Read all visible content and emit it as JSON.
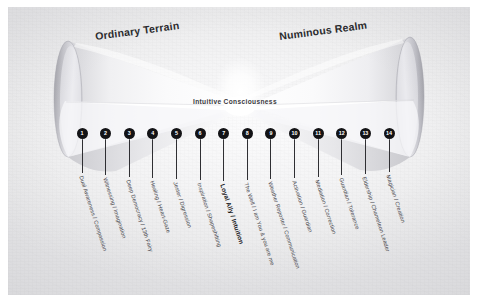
{
  "diagram": {
    "title_left": "Ordinary Terrain",
    "title_right": "Numinous Realm",
    "center_axis_label": "Intuitive Consciousness",
    "nodes": [
      {
        "number": "1",
        "label": "Dual Awareness / Compassion"
      },
      {
        "number": "2",
        "label": "Witnessing / Imagination"
      },
      {
        "number": "3",
        "label": "Deep Democracy / 13th Fairy"
      },
      {
        "number": "4",
        "label": "Healing / Heart-Gaze"
      },
      {
        "number": "5",
        "label": "Jester / Digression"
      },
      {
        "number": "6",
        "label": "Inspiration / Shapeshifting"
      },
      {
        "number": "7",
        "label": "Loyal Ally / Intuition"
      },
      {
        "number": "8",
        "label": "The Well / I am You & you are me"
      },
      {
        "number": "9",
        "label": "Weather Reporter / Communication"
      },
      {
        "number": "10",
        "label": "Activation / Guardian"
      },
      {
        "number": "11",
        "label": "Mediation / Correction"
      },
      {
        "number": "12",
        "label": "Guardian / Tolerance"
      },
      {
        "number": "13",
        "label": "Eldership / Chameleon Leader"
      },
      {
        "number": "14",
        "label": "Magician / Creation"
      }
    ],
    "colors": {
      "node_fill": "#131316",
      "node_text": "#ffffff",
      "label_text": "#44444a",
      "heading_text": "#2b2b2e",
      "paper": "#f2f2f3"
    }
  }
}
